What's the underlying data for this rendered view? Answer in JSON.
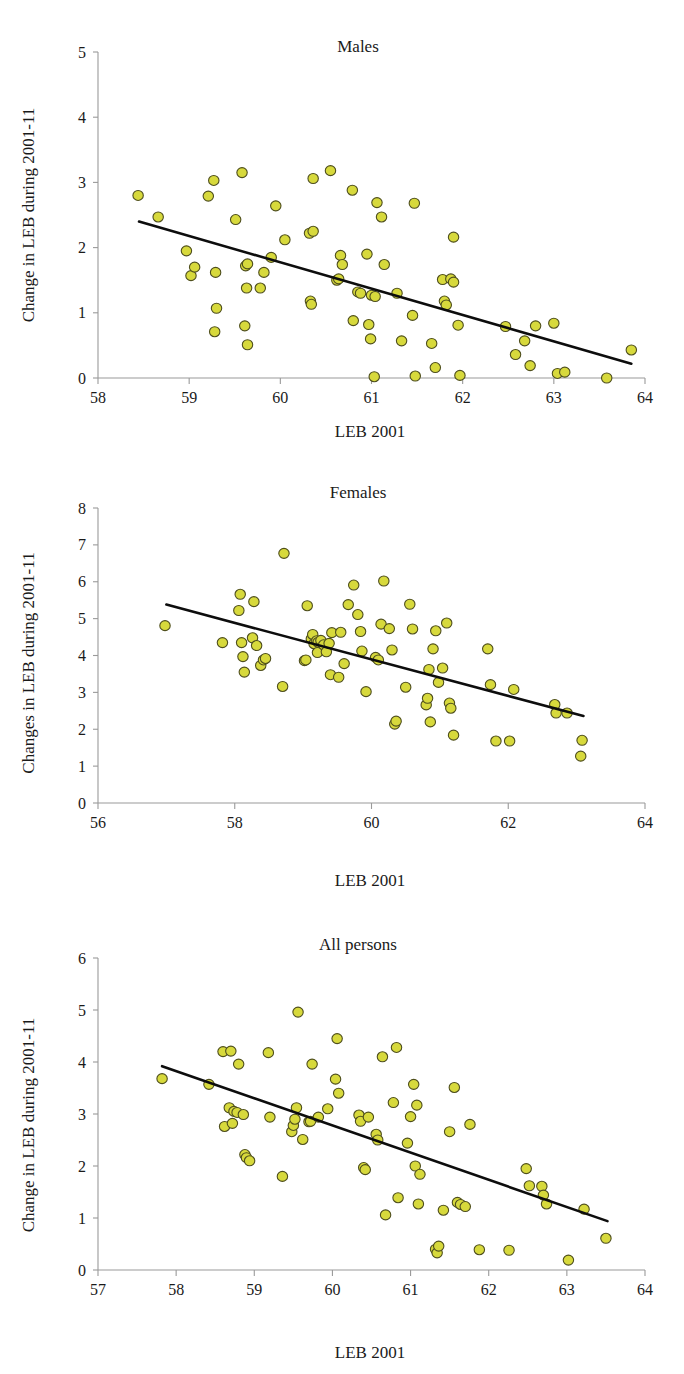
{
  "figure": {
    "kind": "three-panel-scatter",
    "marker_color": "#d7d93c",
    "marker_edge_color": "#4e4e1d",
    "trendline_color": "#0d0d0d",
    "axis_color": "#9a9a9a"
  },
  "panels": [
    {
      "id": "males",
      "title": "Males"
    },
    {
      "id": "females",
      "title": "Females"
    },
    {
      "id": "all",
      "title": "All persons"
    }
  ],
  "chart_data": [
    {
      "type": "scatter",
      "title": "Males",
      "xlabel": "LEB 2001",
      "ylabel": "Change in LEB during 2001-11",
      "xlim": [
        58,
        64
      ],
      "ylim": [
        0,
        5
      ],
      "xticks": [
        58,
        59,
        60,
        61,
        62,
        63,
        64
      ],
      "yticks": [
        0,
        1,
        2,
        3,
        4,
        5
      ],
      "grid": false,
      "legend": "none",
      "trendline": {
        "x": [
          58.45,
          63.85
        ],
        "y": [
          2.4,
          0.22
        ]
      },
      "points": [
        [
          58.44,
          2.8
        ],
        [
          58.66,
          2.47
        ],
        [
          58.97,
          1.95
        ],
        [
          59.02,
          1.57
        ],
        [
          59.06,
          1.7
        ],
        [
          59.21,
          2.79
        ],
        [
          59.27,
          3.03
        ],
        [
          59.29,
          1.62
        ],
        [
          59.3,
          1.07
        ],
        [
          59.28,
          0.71
        ],
        [
          59.51,
          2.43
        ],
        [
          59.58,
          3.15
        ],
        [
          59.62,
          1.72
        ],
        [
          59.64,
          1.75
        ],
        [
          59.63,
          1.38
        ],
        [
          59.61,
          0.8
        ],
        [
          59.64,
          0.51
        ],
        [
          59.78,
          1.38
        ],
        [
          59.82,
          1.62
        ],
        [
          59.9,
          1.85
        ],
        [
          59.95,
          2.64
        ],
        [
          60.05,
          2.12
        ],
        [
          60.33,
          1.18
        ],
        [
          60.34,
          1.13
        ],
        [
          60.32,
          2.22
        ],
        [
          60.36,
          2.25
        ],
        [
          60.36,
          3.06
        ],
        [
          60.55,
          3.18
        ],
        [
          60.62,
          1.5
        ],
        [
          60.64,
          1.52
        ],
        [
          60.66,
          1.88
        ],
        [
          60.68,
          1.74
        ],
        [
          60.79,
          2.88
        ],
        [
          60.8,
          0.88
        ],
        [
          60.85,
          1.32
        ],
        [
          60.88,
          1.3
        ],
        [
          60.95,
          1.9
        ],
        [
          60.97,
          0.82
        ],
        [
          60.99,
          0.6
        ],
        [
          61.03,
          0.02
        ],
        [
          61.0,
          1.27
        ],
        [
          61.04,
          1.25
        ],
        [
          61.06,
          2.69
        ],
        [
          61.11,
          2.47
        ],
        [
          61.14,
          1.74
        ],
        [
          61.28,
          1.3
        ],
        [
          61.33,
          0.57
        ],
        [
          61.45,
          0.96
        ],
        [
          61.47,
          2.68
        ],
        [
          61.48,
          0.03
        ],
        [
          61.66,
          0.53
        ],
        [
          61.7,
          0.16
        ],
        [
          61.78,
          1.51
        ],
        [
          61.8,
          1.18
        ],
        [
          61.82,
          1.12
        ],
        [
          61.87,
          1.52
        ],
        [
          61.9,
          1.47
        ],
        [
          61.9,
          2.16
        ],
        [
          61.95,
          0.81
        ],
        [
          61.97,
          0.04
        ],
        [
          62.47,
          0.79
        ],
        [
          62.58,
          0.36
        ],
        [
          62.68,
          0.57
        ],
        [
          62.74,
          0.19
        ],
        [
          62.8,
          0.8
        ],
        [
          63.04,
          0.07
        ],
        [
          63.12,
          0.09
        ],
        [
          63.0,
          0.84
        ],
        [
          63.58,
          0.0
        ],
        [
          63.85,
          0.43
        ]
      ]
    },
    {
      "type": "scatter",
      "title": "Females",
      "xlabel": "LEB 2001",
      "ylabel": "Changes in LEB during 2001-11",
      "xlim": [
        56,
        64
      ],
      "ylim": [
        0,
        8
      ],
      "xticks": [
        56,
        58,
        60,
        62,
        64
      ],
      "yticks": [
        0,
        1,
        2,
        3,
        4,
        5,
        6,
        7,
        8
      ],
      "grid": false,
      "legend": "none",
      "trendline": {
        "x": [
          57.0,
          63.1
        ],
        "y": [
          5.38,
          2.36
        ]
      },
      "points": [
        [
          56.98,
          4.81
        ],
        [
          57.82,
          4.35
        ],
        [
          58.06,
          5.22
        ],
        [
          58.08,
          5.66
        ],
        [
          58.1,
          4.35
        ],
        [
          58.12,
          3.97
        ],
        [
          58.14,
          3.55
        ],
        [
          58.28,
          5.46
        ],
        [
          58.26,
          4.48
        ],
        [
          58.32,
          4.27
        ],
        [
          58.38,
          3.73
        ],
        [
          58.42,
          3.88
        ],
        [
          58.45,
          3.92
        ],
        [
          58.72,
          6.77
        ],
        [
          58.7,
          3.16
        ],
        [
          59.02,
          3.86
        ],
        [
          59.04,
          3.88
        ],
        [
          59.06,
          5.35
        ],
        [
          59.12,
          4.45
        ],
        [
          59.14,
          4.57
        ],
        [
          59.16,
          4.32
        ],
        [
          59.2,
          4.4
        ],
        [
          59.22,
          4.36
        ],
        [
          59.21,
          4.08
        ],
        [
          59.26,
          4.41
        ],
        [
          59.3,
          4.29
        ],
        [
          59.34,
          4.1
        ],
        [
          59.38,
          4.33
        ],
        [
          59.42,
          4.62
        ],
        [
          59.4,
          3.48
        ],
        [
          59.52,
          3.41
        ],
        [
          59.55,
          4.63
        ],
        [
          59.6,
          3.78
        ],
        [
          59.66,
          5.38
        ],
        [
          59.74,
          5.91
        ],
        [
          59.8,
          5.11
        ],
        [
          59.84,
          4.65
        ],
        [
          59.86,
          4.12
        ],
        [
          59.92,
          3.02
        ],
        [
          60.06,
          3.95
        ],
        [
          60.1,
          3.88
        ],
        [
          60.14,
          4.85
        ],
        [
          60.18,
          6.02
        ],
        [
          60.26,
          4.73
        ],
        [
          60.3,
          4.15
        ],
        [
          60.34,
          2.14
        ],
        [
          60.36,
          2.22
        ],
        [
          60.5,
          3.14
        ],
        [
          60.56,
          5.39
        ],
        [
          60.6,
          4.72
        ],
        [
          60.8,
          2.66
        ],
        [
          60.82,
          2.84
        ],
        [
          60.84,
          3.62
        ],
        [
          60.86,
          2.2
        ],
        [
          60.9,
          4.18
        ],
        [
          60.94,
          4.67
        ],
        [
          60.98,
          3.27
        ],
        [
          61.04,
          3.66
        ],
        [
          61.1,
          4.88
        ],
        [
          61.14,
          2.71
        ],
        [
          61.16,
          2.57
        ],
        [
          61.2,
          1.84
        ],
        [
          61.7,
          4.18
        ],
        [
          61.74,
          3.21
        ],
        [
          61.82,
          1.68
        ],
        [
          62.02,
          1.68
        ],
        [
          62.08,
          3.08
        ],
        [
          62.68,
          2.67
        ],
        [
          62.7,
          2.44
        ],
        [
          62.86,
          2.44
        ],
        [
          63.08,
          1.7
        ],
        [
          63.06,
          1.27
        ]
      ]
    },
    {
      "type": "scatter",
      "title": "All persons",
      "xlabel": "LEB 2001",
      "ylabel": "Change in LEB during 2001-11",
      "xlim": [
        57,
        64
      ],
      "ylim": [
        0,
        6
      ],
      "xticks": [
        57,
        58,
        59,
        60,
        61,
        62,
        63,
        64
      ],
      "yticks": [
        0,
        1,
        2,
        3,
        4,
        5,
        6
      ],
      "grid": false,
      "legend": "none",
      "trendline": {
        "x": [
          57.82,
          63.52
        ],
        "y": [
          3.92,
          0.94
        ]
      },
      "points": [
        [
          57.82,
          3.68
        ],
        [
          58.42,
          3.57
        ],
        [
          58.6,
          4.2
        ],
        [
          58.62,
          2.76
        ],
        [
          58.68,
          3.12
        ],
        [
          58.7,
          4.21
        ],
        [
          58.74,
          3.05
        ],
        [
          58.72,
          2.82
        ],
        [
          58.78,
          3.03
        ],
        [
          58.8,
          3.96
        ],
        [
          58.86,
          2.99
        ],
        [
          58.88,
          2.22
        ],
        [
          58.9,
          2.16
        ],
        [
          58.94,
          2.1
        ],
        [
          59.18,
          4.18
        ],
        [
          59.2,
          2.94
        ],
        [
          59.36,
          1.8
        ],
        [
          59.48,
          2.66
        ],
        [
          59.5,
          2.78
        ],
        [
          59.52,
          2.9
        ],
        [
          59.54,
          3.12
        ],
        [
          59.56,
          4.96
        ],
        [
          59.62,
          2.51
        ],
        [
          59.7,
          2.85
        ],
        [
          59.72,
          2.86
        ],
        [
          59.74,
          3.96
        ],
        [
          59.82,
          2.94
        ],
        [
          59.94,
          3.1
        ],
        [
          60.04,
          3.67
        ],
        [
          60.06,
          4.45
        ],
        [
          60.08,
          3.4
        ],
        [
          60.34,
          2.98
        ],
        [
          60.36,
          2.86
        ],
        [
          60.4,
          1.97
        ],
        [
          60.42,
          1.93
        ],
        [
          60.46,
          2.94
        ],
        [
          60.56,
          2.61
        ],
        [
          60.58,
          2.5
        ],
        [
          60.64,
          4.1
        ],
        [
          60.68,
          1.06
        ],
        [
          60.78,
          3.22
        ],
        [
          60.82,
          4.28
        ],
        [
          60.84,
          1.39
        ],
        [
          60.96,
          2.44
        ],
        [
          61.0,
          2.95
        ],
        [
          61.04,
          3.57
        ],
        [
          61.06,
          2.0
        ],
        [
          61.08,
          3.17
        ],
        [
          61.1,
          1.27
        ],
        [
          61.12,
          1.84
        ],
        [
          61.32,
          0.4
        ],
        [
          61.34,
          0.33
        ],
        [
          61.36,
          0.46
        ],
        [
          61.42,
          1.15
        ],
        [
          61.5,
          2.66
        ],
        [
          61.56,
          3.51
        ],
        [
          61.6,
          1.3
        ],
        [
          61.64,
          1.26
        ],
        [
          61.7,
          1.22
        ],
        [
          61.76,
          2.8
        ],
        [
          61.88,
          0.39
        ],
        [
          62.26,
          0.38
        ],
        [
          62.48,
          1.95
        ],
        [
          62.52,
          1.62
        ],
        [
          62.68,
          1.61
        ],
        [
          62.7,
          1.44
        ],
        [
          62.74,
          1.27
        ],
        [
          63.02,
          0.19
        ],
        [
          63.22,
          1.17
        ],
        [
          63.5,
          0.61
        ]
      ]
    }
  ]
}
